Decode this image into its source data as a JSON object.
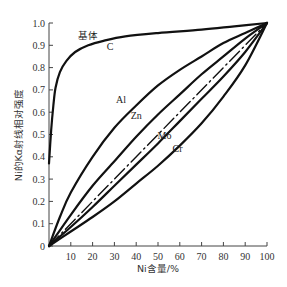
{
  "chart_data": {
    "type": "line",
    "title": "",
    "xlabel": "Ni含量/%",
    "ylabel": "Ni的Kα射线相对强度",
    "xlim": [
      0,
      100
    ],
    "ylim": [
      0,
      1.0
    ],
    "grid": false,
    "legend": "inline labels",
    "x_ticks": [
      "10",
      "20",
      "30",
      "40",
      "50",
      "60",
      "70",
      "80",
      "90",
      "100"
    ],
    "y_ticks": [
      "0",
      "0.1",
      "0.2",
      "0.3",
      "0.4",
      "0.5",
      "0.6",
      "0.7",
      "0.8",
      "0.9",
      "1.0"
    ],
    "annotations": [
      {
        "text": "基体",
        "x": 18,
        "y": 0.93
      },
      {
        "text": "C",
        "x": 28,
        "y": 0.88
      },
      {
        "text": "Al",
        "x": 33,
        "y": 0.64
      },
      {
        "text": "Zn",
        "x": 40,
        "y": 0.57
      },
      {
        "text": "Mo",
        "x": 53,
        "y": 0.48
      },
      {
        "text": "Cr",
        "x": 59,
        "y": 0.42
      }
    ],
    "series": [
      {
        "name": "C",
        "style": "solid",
        "x": [
          0,
          1,
          2,
          3,
          5,
          8,
          12,
          18,
          25,
          35,
          50,
          70,
          85,
          100
        ],
        "y": [
          0.37,
          0.52,
          0.63,
          0.71,
          0.78,
          0.83,
          0.87,
          0.9,
          0.92,
          0.94,
          0.955,
          0.97,
          0.985,
          1.0
        ]
      },
      {
        "name": "Al",
        "style": "solid",
        "x": [
          0,
          5,
          10,
          20,
          30,
          40,
          50,
          60,
          70,
          80,
          90,
          100
        ],
        "y": [
          0,
          0.13,
          0.24,
          0.4,
          0.53,
          0.63,
          0.72,
          0.79,
          0.85,
          0.91,
          0.955,
          1.0
        ]
      },
      {
        "name": "Zn",
        "style": "solid",
        "x": [
          0,
          10,
          20,
          30,
          40,
          50,
          60,
          70,
          80,
          90,
          100
        ],
        "y": [
          0,
          0.14,
          0.27,
          0.38,
          0.49,
          0.59,
          0.68,
          0.77,
          0.85,
          0.93,
          1.0
        ]
      },
      {
        "name": "基体",
        "style": "dash-dot",
        "x": [
          0,
          100
        ],
        "y": [
          0,
          1.0
        ]
      },
      {
        "name": "Mo",
        "style": "solid",
        "x": [
          0,
          10,
          20,
          30,
          40,
          50,
          60,
          70,
          80,
          90,
          100
        ],
        "y": [
          0,
          0.085,
          0.175,
          0.27,
          0.365,
          0.46,
          0.56,
          0.66,
          0.76,
          0.87,
          1.0
        ]
      },
      {
        "name": "Cr",
        "style": "solid",
        "x": [
          0,
          10,
          20,
          30,
          40,
          50,
          60,
          70,
          80,
          90,
          100
        ],
        "y": [
          0,
          0.065,
          0.13,
          0.2,
          0.28,
          0.36,
          0.45,
          0.55,
          0.67,
          0.81,
          1.0
        ]
      }
    ]
  },
  "plot_area": {
    "x0": 49,
    "x1": 267,
    "y0": 246,
    "y1": 23
  },
  "colors": {
    "line": "#111111",
    "axis": "#444444",
    "text": "#333333"
  }
}
